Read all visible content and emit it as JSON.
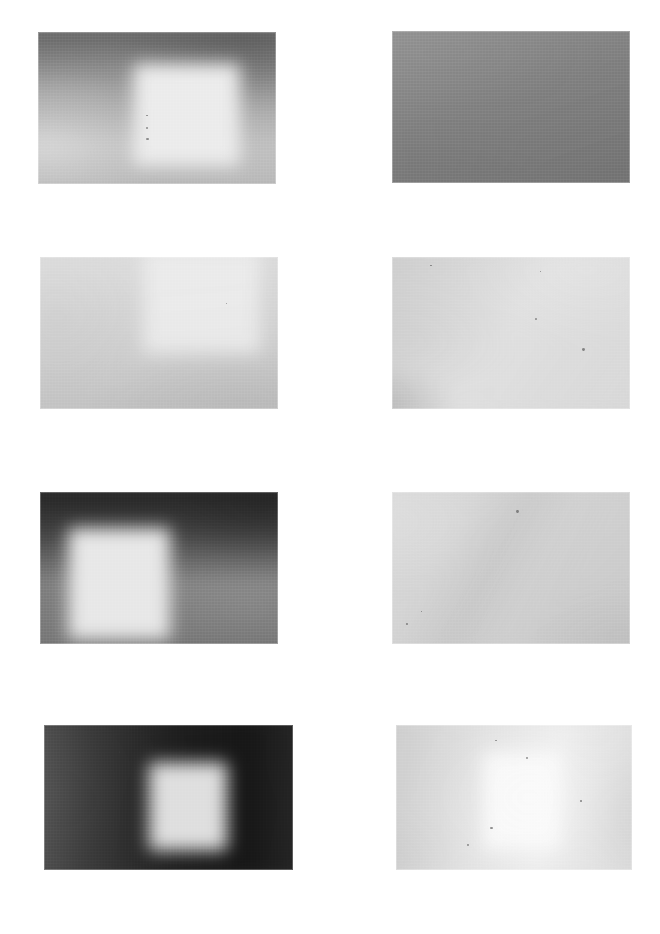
{
  "page": {
    "background_color": "#ffffff",
    "width": 660,
    "height": 934,
    "columns": 2,
    "rows": 4,
    "panel_count": 8
  },
  "panels": [
    {
      "id": "panel-1",
      "name": "row1-left",
      "row": 1,
      "column": 1,
      "x": 38,
      "y": 32,
      "width": 238,
      "height": 152,
      "caption": "",
      "base_color": "#a9a9a9",
      "dominant_tone": "mid-gray",
      "has_bright_rectangle": true,
      "bright_rect": {
        "x": 0.41,
        "y": 0.24,
        "width": 0.4,
        "height": 0.6,
        "color": "#ececec"
      },
      "dark_region": "top-right",
      "specks": 3
    },
    {
      "id": "panel-2",
      "name": "row1-right",
      "row": 1,
      "column": 2,
      "x": 392,
      "y": 31,
      "width": 238,
      "height": 152,
      "caption": "",
      "base_color": "#8f8f8f",
      "dominant_tone": "uniform mid-gray",
      "has_bright_rectangle": false,
      "bright_rect": null,
      "dark_region": "bottom-left",
      "specks": 0
    },
    {
      "id": "panel-3",
      "name": "row2-left",
      "row": 2,
      "column": 1,
      "x": 40,
      "y": 257,
      "width": 238,
      "height": 152,
      "caption": "",
      "base_color": "#d2d2d2",
      "dominant_tone": "light gray",
      "has_bright_rectangle": true,
      "bright_rect": {
        "x": 0.44,
        "y": 0.0,
        "width": 0.44,
        "height": 0.62,
        "color": "#efefef"
      },
      "dark_region": "bottom-right",
      "specks": 1
    },
    {
      "id": "panel-4",
      "name": "row2-right",
      "row": 2,
      "column": 2,
      "x": 392,
      "y": 257,
      "width": 238,
      "height": 152,
      "caption": "",
      "base_color": "#dadada",
      "dominant_tone": "light gray with soft diagonal",
      "has_bright_rectangle": false,
      "bright_rect": null,
      "dark_region": "bottom-left-corner-dark",
      "specks": 4
    },
    {
      "id": "panel-5",
      "name": "row3-left",
      "row": 3,
      "column": 1,
      "x": 40,
      "y": 492,
      "width": 238,
      "height": 152,
      "caption": "",
      "base_color": "#6e6e6e",
      "dominant_tone": "dark gray",
      "has_bright_rectangle": true,
      "bright_rect": {
        "x": 0.16,
        "y": 0.26,
        "width": 0.38,
        "height": 0.66,
        "color": "#e8e8e8"
      },
      "dark_region": "top-band",
      "specks": 0
    },
    {
      "id": "panel-6",
      "name": "row3-right",
      "row": 3,
      "column": 2,
      "x": 392,
      "y": 492,
      "width": 238,
      "height": 152,
      "caption": "",
      "base_color": "#cfcfcf",
      "dominant_tone": "light gray with diagonal shadow sweep",
      "has_bright_rectangle": false,
      "bright_rect": null,
      "dark_region": "diagonal-band",
      "specks": 3
    },
    {
      "id": "panel-7",
      "name": "row4-left",
      "row": 4,
      "column": 1,
      "x": 44,
      "y": 725,
      "width": 249,
      "height": 145,
      "caption": "",
      "base_color": "#3a3a3a",
      "dominant_tone": "very dark",
      "has_bright_rectangle": true,
      "bright_rect": {
        "x": 0.43,
        "y": 0.28,
        "width": 0.28,
        "height": 0.55,
        "color": "#dfdfdf"
      },
      "dark_region": "full-frame-dark",
      "specks": 1
    },
    {
      "id": "panel-8",
      "name": "row4-right",
      "row": 4,
      "column": 2,
      "x": 396,
      "y": 725,
      "width": 236,
      "height": 145,
      "caption": "",
      "base_color": "#e2e2e2",
      "dominant_tone": "washed-out near-white",
      "has_bright_rectangle": true,
      "bright_rect": {
        "x": 0.38,
        "y": 0.22,
        "width": 0.3,
        "height": 0.6,
        "color": "#fbfbfb"
      },
      "dark_region": "right-edge",
      "specks": 5
    }
  ],
  "colors": {
    "page_background": "#ffffff",
    "darkest": "#2a2a2a",
    "lightest": "#fcfcfc",
    "mid_gray": "#9a9a9a"
  }
}
